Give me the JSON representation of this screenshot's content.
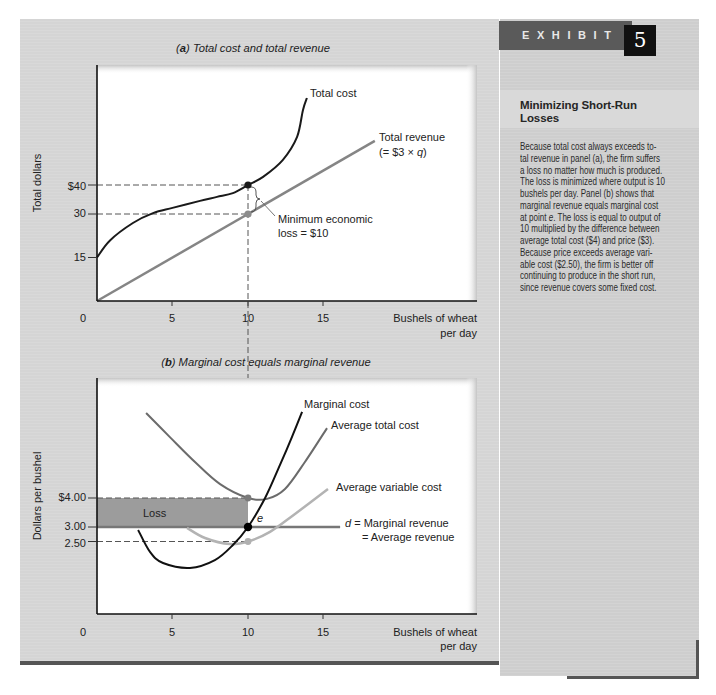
{
  "exhibit": {
    "label": "EXHIBIT",
    "number": "5"
  },
  "sidebar": {
    "heading_lines": [
      "Minimizing Short-Run",
      "Losses"
    ],
    "body_lines": [
      "Because total cost always exceeds to-",
      "tal revenue in panel (a), the firm suffers",
      "a loss no matter how much is produced.",
      "The loss is minimized where output is 10",
      "bushels per day. Panel (b) shows that",
      "marginal revenue equals marginal cost",
      [
        "at point ",
        "e",
        ". The loss is equal to output of"
      ],
      "10 multiplied by the difference between",
      "average total cost ($4) and price ($3).",
      "Because price exceeds average vari-",
      "able cost ($2.50), the firm is better off",
      "continuing to produce in the short run,",
      "since revenue covers some fixed cost."
    ]
  },
  "panel_a": {
    "title_parts": {
      "open": "(",
      "letter": "a",
      "rest": ") Total cost and total revenue"
    },
    "ylabel": "Total dollars",
    "xlabel_lines": [
      "Bushels of wheat",
      "per day"
    ],
    "total_cost_label": "Total cost",
    "total_revenue_label": "Total revenue",
    "total_revenue_formula": {
      "pre": "(= $3 × ",
      "var": "q",
      "post": ")"
    },
    "loss_annotation_lines": [
      "Minimum economic",
      "loss = $10"
    ]
  },
  "panel_b": {
    "title_parts": {
      "open": "(",
      "letter": "b",
      "rest": ") Marginal cost equals marginal revenue"
    },
    "ylabel": "Dollars per bushel",
    "xlabel_lines": [
      "Bushels of wheat",
      "per day"
    ],
    "mc_label": "Marginal cost",
    "atc_label": "Average total cost",
    "avc_label": "Average variable cost",
    "mr_label": {
      "var": "d",
      "rest": " = Marginal revenue"
    },
    "ar_label": "= Average revenue",
    "loss_label": "Loss",
    "point_label": "e"
  },
  "chart_data": [
    {
      "type": "line",
      "title": "(a) Total cost and total revenue",
      "xlabel": "Bushels of wheat per day",
      "ylabel": "Total dollars",
      "x_ticks": [
        "0",
        "5",
        "10",
        "15"
      ],
      "y_ticks": [
        {
          "value": 15,
          "label": "15"
        },
        {
          "value": 30,
          "label": "30"
        },
        {
          "value": 40,
          "label": "$40"
        }
      ],
      "xlim": [
        0,
        25
      ],
      "ylim": [
        0,
        81
      ],
      "grid": false,
      "legend": "none (direct labels)",
      "series": [
        {
          "name": "Total cost",
          "color": "#1a1a1a",
          "points": [
            [
              0,
              15
            ],
            [
              0.86,
              20.9
            ],
            [
              2.38,
              26.9
            ],
            [
              3.71,
              30.3
            ],
            [
              5,
              32.1
            ],
            [
              6.82,
              34.5
            ],
            [
              7.95,
              35.9
            ],
            [
              9,
              37.2
            ],
            [
              10,
              40
            ],
            [
              11,
              42.8
            ],
            [
              12.3,
              48.6
            ],
            [
              13.25,
              56.6
            ],
            [
              13.64,
              65.9
            ],
            [
              13.9,
              70
            ]
          ]
        },
        {
          "name": "Total revenue (= $3 × q)",
          "color": "#858585",
          "straight": true,
          "points": [
            [
              0,
              0
            ],
            [
              18.4,
              55.2
            ]
          ]
        }
      ],
      "marked_points": [
        {
          "x": 10,
          "y": 40,
          "color": "#1a1a1a",
          "guide": true
        },
        {
          "x": 10,
          "y": 30,
          "color": "#8c8c8c",
          "guide": true
        }
      ],
      "annotations": [
        {
          "text": "Minimum economic loss = $10",
          "x": 10,
          "from": 30,
          "to": 40
        }
      ]
    },
    {
      "type": "line",
      "title": "(b) Marginal cost equals marginal revenue",
      "xlabel": "Bushels of wheat per day",
      "ylabel": "Dollars per bushel",
      "x_ticks": [
        "0",
        "5",
        "10",
        "15"
      ],
      "y_ticks": [
        {
          "value": 2.5,
          "label": "2.50"
        },
        {
          "value": 3.0,
          "label": "3.00"
        },
        {
          "value": 4.0,
          "label": "$4.00"
        }
      ],
      "xlim": [
        0,
        25
      ],
      "ylim": [
        0,
        8.1
      ],
      "grid": false,
      "legend": "none (direct labels)",
      "series": [
        {
          "name": "Marginal cost",
          "color": "#111111",
          "points": [
            [
              2.72,
              2.9
            ],
            [
              3.51,
              2.14
            ],
            [
              4.37,
              1.76
            ],
            [
              6.16,
              1.59
            ],
            [
              7.81,
              1.86
            ],
            [
              9,
              2.38
            ],
            [
              10,
              3.0
            ],
            [
              11.13,
              4.0
            ],
            [
              12.12,
              5.14
            ],
            [
              12.91,
              6.1
            ],
            [
              13.58,
              6.97
            ]
          ]
        },
        {
          "name": "Average total cost",
          "color": "#6b6b6b",
          "points": [
            [
              3.25,
              6.93
            ],
            [
              4.83,
              6.1
            ],
            [
              6.49,
              5.24
            ],
            [
              8.15,
              4.48
            ],
            [
              10,
              4.0
            ],
            [
              11.26,
              3.97
            ],
            [
              12.45,
              4.31
            ],
            [
              13.77,
              5.24
            ],
            [
              15.23,
              6.41
            ]
          ]
        },
        {
          "name": "Average variable cost",
          "color": "#b3b3b3",
          "points": [
            [
              5.96,
              2.97
            ],
            [
              7.15,
              2.62
            ],
            [
              8.81,
              2.41
            ],
            [
              10,
              2.5
            ],
            [
              11.46,
              2.83
            ],
            [
              13.11,
              3.45
            ],
            [
              15.3,
              4.31
            ]
          ]
        },
        {
          "name": "d = Marginal revenue = Average revenue",
          "color": "#777777",
          "straight": true,
          "points": [
            [
              0,
              3
            ],
            [
              16.1,
              3
            ]
          ]
        }
      ],
      "marked_points": [
        {
          "x": 10,
          "y": 4.0,
          "color": "#7a7a7a",
          "guide": true
        },
        {
          "x": 10,
          "y": 3.0,
          "color": "#000000",
          "guide": false,
          "label": "e"
        },
        {
          "x": 10,
          "y": 2.5,
          "color": "#b0b0b0",
          "guide": true
        }
      ],
      "shaded_region": {
        "label": "Loss",
        "x": [
          0,
          10
        ],
        "y": [
          3.0,
          4.0
        ],
        "color": "#9c9c9c"
      }
    }
  ]
}
